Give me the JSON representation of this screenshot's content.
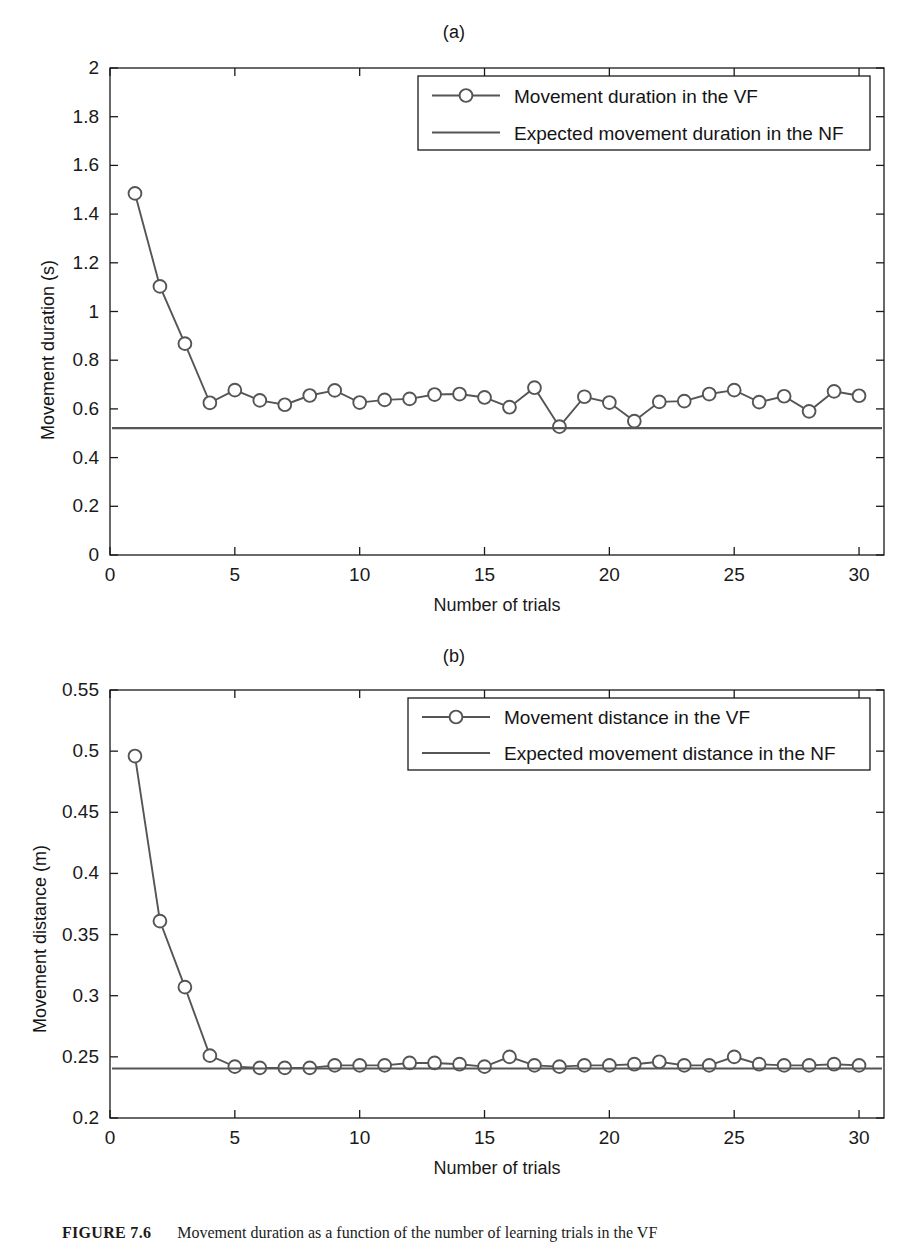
{
  "figure": {
    "caption_number": "FIGURE 7.6",
    "caption_text": "Movement duration as a function of the number of learning trials in the VF"
  },
  "panels": [
    {
      "id": "a",
      "title": "(a)",
      "legend": {
        "entries": [
          {
            "label": "Movement duration in the VF",
            "marker": "circle-line",
            "color": "#555555"
          },
          {
            "label": "Expected movement duration in the NF",
            "marker": "line",
            "color": "#555555"
          }
        ]
      }
    },
    {
      "id": "b",
      "title": "(b)",
      "legend": {
        "entries": [
          {
            "label": "Movement distance in the VF",
            "marker": "circle-line",
            "color": "#555555"
          },
          {
            "label": "Expected movement distance in the NF",
            "marker": "line",
            "color": "#555555"
          }
        ]
      }
    }
  ],
  "chart_data": [
    {
      "type": "line",
      "panel": "a",
      "title": "(a)",
      "xlabel": "Number of trials",
      "ylabel": "Movement duration (s)",
      "xlim": [
        0,
        31
      ],
      "ylim": [
        0,
        2
      ],
      "xticks": [
        0,
        5,
        10,
        15,
        20,
        25,
        30
      ],
      "yticks": [
        0,
        0.2,
        0.4,
        0.6,
        0.8,
        1,
        1.2,
        1.4,
        1.6,
        1.8,
        2
      ],
      "ytick_labels": [
        "0",
        "0.2",
        "0.4",
        "0.6",
        "0.8",
        "1",
        "1.2",
        "1.4",
        "1.6",
        "1.8",
        "2"
      ],
      "grid": false,
      "legend_position": "upper right",
      "x": [
        1,
        2,
        3,
        4,
        5,
        6,
        7,
        8,
        9,
        10,
        11,
        12,
        13,
        14,
        15,
        16,
        17,
        18,
        19,
        20,
        21,
        22,
        23,
        24,
        25,
        26,
        27,
        28,
        29,
        30
      ],
      "series": [
        {
          "name": "Movement duration in the VF",
          "marker": "o",
          "color": "#555555",
          "values": [
            1.485,
            1.103,
            0.868,
            0.625,
            0.677,
            0.635,
            0.617,
            0.655,
            0.676,
            0.626,
            0.637,
            0.641,
            0.659,
            0.661,
            0.647,
            0.607,
            0.687,
            0.527,
            0.65,
            0.626,
            0.55,
            0.629,
            0.632,
            0.661,
            0.677,
            0.628,
            0.652,
            0.59,
            0.672,
            0.654
          ]
        },
        {
          "name": "Expected movement duration in the NF",
          "marker": "none",
          "color": "#555555",
          "constant_value": 0.521
        }
      ]
    },
    {
      "type": "line",
      "panel": "b",
      "title": "(b)",
      "xlabel": "Number of trials",
      "ylabel": "Movement distance (m)",
      "xlim": [
        0,
        31
      ],
      "ylim": [
        0.2,
        0.55
      ],
      "xticks": [
        0,
        5,
        10,
        15,
        20,
        25,
        30
      ],
      "yticks": [
        0.2,
        0.25,
        0.3,
        0.35,
        0.4,
        0.45,
        0.5,
        0.55
      ],
      "ytick_labels": [
        "0.2",
        "0.25",
        "0.3",
        "0.35",
        "0.4",
        "0.45",
        "0.5",
        "0.55"
      ],
      "grid": false,
      "legend_position": "upper right",
      "x": [
        1,
        2,
        3,
        4,
        5,
        6,
        7,
        8,
        9,
        10,
        11,
        12,
        13,
        14,
        15,
        16,
        17,
        18,
        19,
        20,
        21,
        22,
        23,
        24,
        25,
        26,
        27,
        28,
        29,
        30
      ],
      "series": [
        {
          "name": "Movement distance in the VF",
          "marker": "o",
          "color": "#555555",
          "values": [
            0.496,
            0.361,
            0.307,
            0.251,
            0.242,
            0.241,
            0.241,
            0.241,
            0.243,
            0.243,
            0.243,
            0.245,
            0.245,
            0.244,
            0.242,
            0.25,
            0.243,
            0.242,
            0.243,
            0.243,
            0.244,
            0.246,
            0.243,
            0.243,
            0.25,
            0.244,
            0.243,
            0.243,
            0.244,
            0.243
          ]
        },
        {
          "name": "Expected movement distance in the NF",
          "marker": "none",
          "color": "#555555",
          "constant_value": 0.2405
        }
      ]
    }
  ]
}
